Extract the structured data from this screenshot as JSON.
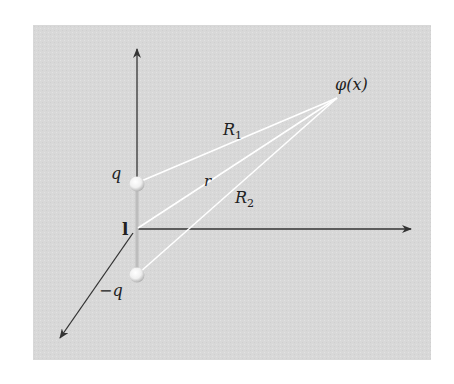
{
  "diagram": {
    "type": "electric-dipole-potential",
    "background_color": "#d9d9d9",
    "line_color": "#ffffff",
    "axis_color": "#333333",
    "labels": {
      "field_point": "φ(x)",
      "charge_positive": "q",
      "charge_negative": "−q",
      "separation_vector": "l",
      "distance_1_base": "R",
      "distance_1_sub": "1",
      "distance_2_base": "R",
      "distance_2_sub": "2",
      "distance_center": "r"
    },
    "axes": [
      "vertical-axis",
      "horizontal-axis",
      "depth-axis"
    ],
    "charges": [
      {
        "name": "positive-charge",
        "label": "q"
      },
      {
        "name": "negative-charge",
        "label": "−q"
      }
    ]
  }
}
